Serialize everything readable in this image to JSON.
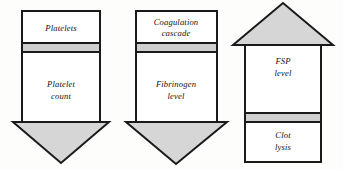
{
  "figure": {
    "title": "",
    "background_color": "#fdfdfc",
    "outline_color": "#1a1a1a",
    "head_fill_color": "#d6d6d6",
    "band_fill_color": "#cfcfcf",
    "body_fill_color": "#ffffff"
  },
  "arrows": [
    {
      "id": "platelets-arrow",
      "direction": "down",
      "head_position": "bottom",
      "segments": [
        {
          "id": "platelets",
          "lines": [
            "Platelets"
          ]
        },
        {
          "id": "platelet-count",
          "lines": [
            "Platelet",
            "count"
          ]
        }
      ]
    },
    {
      "id": "coagulation-arrow",
      "direction": "down",
      "head_position": "bottom",
      "segments": [
        {
          "id": "coagulation-cascade",
          "lines": [
            "Coagulation",
            "cascade"
          ]
        },
        {
          "id": "fibrinogen-level",
          "lines": [
            "Fibrinogen",
            "level"
          ]
        }
      ]
    },
    {
      "id": "fsp-arrow",
      "direction": "up",
      "head_position": "top",
      "segments": [
        {
          "id": "fsp-level",
          "lines": [
            "FSP",
            "level"
          ]
        },
        {
          "id": "clot-lysis",
          "lines": [
            "Clot",
            "lysis"
          ]
        }
      ]
    }
  ]
}
